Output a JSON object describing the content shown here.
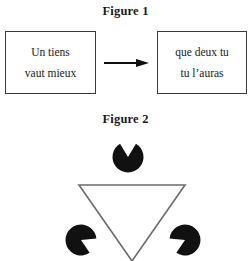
{
  "figure1": {
    "title": "Figure 1",
    "left_box": {
      "line1": "Un tiens",
      "line2": "vaut mieux"
    },
    "right_box": {
      "line1": "que deux tu",
      "line2": "tu l’auras"
    },
    "arrow": "→"
  },
  "figure2": {
    "title": "Figure 2",
    "illusion_name": "kanizsa-triangle"
  },
  "colors": {
    "ink": "#1a1a1a",
    "box_border": "#3a3a3a",
    "arrow": "#111111",
    "pacman_fill": "#111111",
    "triangle_stroke": "#6b6b6b",
    "background": "#ffffff"
  },
  "chart_data": {
    "type": "diagram",
    "title": "Figure 2",
    "triangle": {
      "stroke": "#6b6b6b",
      "stroke_width": 1.6,
      "fill": "none",
      "points": [
        {
          "x": 79,
          "y": 57
        },
        {
          "x": 185,
          "y": 57
        },
        {
          "x": 132,
          "y": 133
        }
      ]
    },
    "pacmen": [
      {
        "name": "top-disc",
        "cx": 128,
        "cy": 29,
        "r": 15.5,
        "notch_direction_deg": 90,
        "notch_span_deg": 62
      },
      {
        "name": "bottom-left-disc",
        "cx": 81,
        "cy": 112,
        "r": 15.5,
        "notch_direction_deg": 335,
        "notch_span_deg": 62
      },
      {
        "name": "bottom-right-disc",
        "cx": 185,
        "cy": 112,
        "r": 15.5,
        "notch_direction_deg": 205,
        "notch_span_deg": 62
      }
    ]
  }
}
